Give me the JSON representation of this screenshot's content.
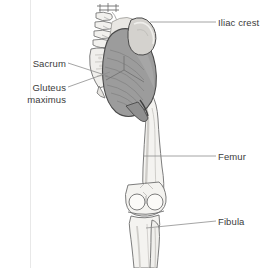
{
  "figure": {
    "background_color": "#ffffff",
    "width": 274,
    "height": 268
  },
  "colors": {
    "background": "#ffffff",
    "label_text": "#3b3b3b",
    "leader_line": "#8d8d8d",
    "muscle_fill": "#9c9c9c",
    "muscle_fill_light": "#b4b4b4",
    "muscle_outline": "#4a4a4a",
    "bone_fill": "#f2f1ee",
    "bone_outline": "#6e6e6e",
    "bone_shade": "#d8d6d2",
    "iliac_crest_fill": "#cfcdc9",
    "margin_rule": "#e2e2e2"
  },
  "labels": [
    {
      "id": "iliac-crest",
      "text": "Iliac crest",
      "side": "right",
      "structure": "ilium",
      "leader_from": [
        218,
        22
      ],
      "leader_to": [
        150,
        22
      ]
    },
    {
      "id": "sacrum",
      "text": "Sacrum",
      "side": "left",
      "structure": "sacrum",
      "leader_from": [
        70,
        64
      ],
      "leader_to": [
        106,
        76
      ]
    },
    {
      "id": "gluteus-maximus",
      "text": "Gluteus\nmaximus",
      "line1": "Gluteus",
      "line2": "maximus",
      "side": "left",
      "structure": "gluteus-maximus-muscle",
      "leader_from": [
        70,
        88
      ],
      "leader_to": [
        108,
        72
      ]
    },
    {
      "id": "femur",
      "text": "Femur",
      "side": "right",
      "structure": "femur",
      "leader_from": [
        218,
        156
      ],
      "leader_to": [
        143,
        156
      ]
    },
    {
      "id": "fibula",
      "text": "Fibula",
      "side": "right",
      "structure": "fibula",
      "leader_from": [
        218,
        221
      ],
      "leader_to": [
        146,
        228
      ]
    }
  ],
  "structures": [
    {
      "id": "lumbar-vertebrae",
      "name": "Lumbar vertebrae",
      "visible": true
    },
    {
      "id": "sacrum",
      "name": "Sacrum",
      "visible": true
    },
    {
      "id": "ilium",
      "name": "Ilium / iliac crest",
      "visible": true
    },
    {
      "id": "gluteus-maximus",
      "name": "Gluteus maximus",
      "visible": true
    },
    {
      "id": "femur",
      "name": "Femur",
      "visible": true
    },
    {
      "id": "patella-region",
      "name": "Knee joint",
      "visible": true
    },
    {
      "id": "tibia",
      "name": "Tibia",
      "visible": true
    },
    {
      "id": "fibula",
      "name": "Fibula",
      "visible": true
    }
  ]
}
